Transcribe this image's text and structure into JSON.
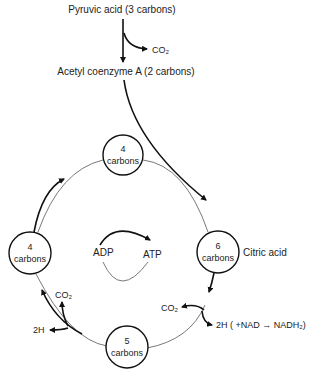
{
  "diagram": {
    "input": {
      "pyruvic": "Pyruvic acid (3 carbons)",
      "co2_release": "CO₂",
      "acetyl": "Acetyl coenzyme A (2 carbons)"
    },
    "nodes": [
      {
        "id": "top",
        "num": "4",
        "unit": "carbons"
      },
      {
        "id": "right",
        "num": "6",
        "unit": "carbons",
        "side_label": "Citric acid"
      },
      {
        "id": "bottom",
        "num": "5",
        "unit": "carbons"
      },
      {
        "id": "left",
        "num": "4",
        "unit": "carbons"
      }
    ],
    "atp_cycle": {
      "from": "ADP",
      "to": "ATP"
    },
    "right_branch": {
      "co2": "CO₂",
      "h": "2H ( +NAD → NADH₂)"
    },
    "left_branch": {
      "co2": "CO₂",
      "h": "2H"
    }
  }
}
